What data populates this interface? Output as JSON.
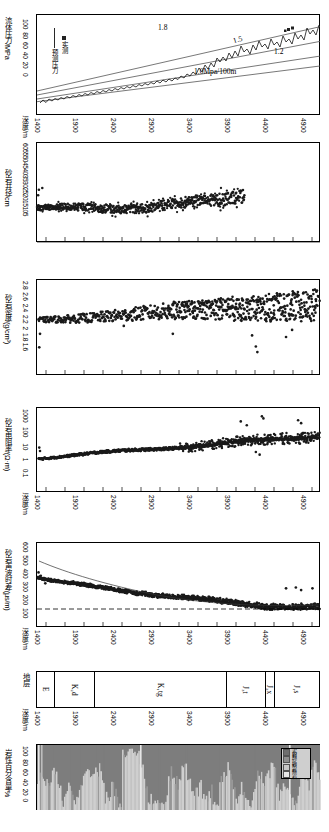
{
  "figure": {
    "xaxis_label": "深度/m",
    "xticks": [
      1400,
      1900,
      2400,
      2900,
      3400,
      3900,
      4400,
      4900
    ],
    "xlim": [
      1400,
      5150
    ]
  },
  "panels": [
    {
      "id": "fluid-pressure",
      "ylabel": "流体压力/MPa",
      "yticks": [
        "0",
        "20",
        "40",
        "60",
        "80",
        "100"
      ],
      "ylim": [
        0,
        105
      ],
      "legend": [
        {
          "marker": "line",
          "label": "预测压力"
        },
        {
          "marker": "square",
          "label": "实测"
        }
      ],
      "annotations": [
        "1.8",
        "1.5",
        "1.2",
        "1.0Mpa/100m"
      ]
    },
    {
      "id": "sandstone-caliper",
      "ylabel": "砂岩井径/cm",
      "yticks": [
        "5",
        "10",
        "15",
        "20",
        "25",
        "30",
        "35",
        "40",
        "45",
        "50",
        "55",
        "60"
      ],
      "ylim": [
        5,
        60
      ]
    },
    {
      "id": "sandstone-density",
      "ylabel": "砂岩密度/(g/cm³)",
      "yticks": [
        "1.6",
        "1.8",
        "2",
        "2.2",
        "2.4",
        "2.6",
        "2.8"
      ],
      "ylim": [
        1.6,
        2.8
      ]
    },
    {
      "id": "sandstone-resistivity",
      "ylabel": "砂岩电阻率/(Ω·m)",
      "yticks": [
        "0.1",
        "1",
        "10",
        "100",
        "1000"
      ],
      "ylim": [
        0.1,
        1000
      ],
      "scale": "log"
    },
    {
      "id": "sandstone-sonic",
      "ylabel": "砂岩声波时差/(μs/m)",
      "yticks": [
        "100",
        "200",
        "300",
        "400",
        "500",
        "600"
      ],
      "ylim": [
        100,
        600
      ],
      "reference_line": 200
    },
    {
      "id": "stratigraphy",
      "ylabel": "地层",
      "units": [
        {
          "label": "E",
          "start": 1400,
          "end": 1640
        },
        {
          "label": "K₂d",
          "start": 1640,
          "end": 2165
        },
        {
          "label": "K₁tg",
          "start": 2165,
          "end": 3930
        },
        {
          "label": "J₃t",
          "start": 3930,
          "end": 4440
        },
        {
          "label": "J₂x",
          "start": 4440,
          "end": 4560
        },
        {
          "label": "J₁s",
          "start": 4560,
          "end": 5150
        }
      ]
    },
    {
      "id": "lithology-percent",
      "ylabel": "岩性百分含量/%",
      "yticks": [
        "0",
        "20",
        "40",
        "60",
        "80",
        "100"
      ],
      "ylim": [
        0,
        100
      ],
      "legend": [
        {
          "label": "泥岩",
          "color": "#6e6e6e"
        },
        {
          "label": "粉砂岩",
          "color": "#8f8f8f"
        },
        {
          "label": "砂岩",
          "color": "#c8c8c8"
        },
        {
          "label": "砾岩",
          "color": "#e8e8e8"
        }
      ]
    }
  ],
  "chart_data": {
    "type": "scatter",
    "title": "",
    "xlabel": "深度/m",
    "grid": false,
    "legend_position": "inside-left",
    "series": [
      {
        "name": "预测压力 (1.0Mpa/100m gradient)",
        "panel": "fluid-pressure",
        "type": "line",
        "x": [
          1400,
          5150
        ],
        "values": [
          14,
          51.5
        ]
      },
      {
        "name": "1.2 gradient",
        "panel": "fluid-pressure",
        "type": "line",
        "x": [
          1400,
          5150
        ],
        "values": [
          16.8,
          61.8
        ]
      },
      {
        "name": "1.5 gradient",
        "panel": "fluid-pressure",
        "type": "line",
        "x": [
          1400,
          5150
        ],
        "values": [
          21,
          77.3
        ]
      },
      {
        "name": "1.8 gradient",
        "panel": "fluid-pressure",
        "type": "line",
        "x": [
          1400,
          5150
        ],
        "values": [
          25.2,
          92.7
        ]
      },
      {
        "name": "实测压力",
        "panel": "fluid-pressure",
        "type": "line-rough",
        "x": [
          1400,
          1500,
          1600,
          1700,
          1800,
          1900,
          2000,
          2100,
          2200,
          2300,
          2400,
          2500,
          2600,
          2700,
          2800,
          2900,
          3000,
          3100,
          3200,
          3300,
          3400,
          3500,
          3600,
          3700,
          3800,
          3900,
          4000,
          4100,
          4200,
          4300,
          4400,
          4500,
          4600,
          4700,
          4800,
          4900,
          5000,
          5100
        ],
        "values": [
          12,
          14,
          15,
          17,
          18,
          19,
          20,
          22,
          23,
          25,
          26,
          28,
          29,
          31,
          32,
          34,
          35,
          36,
          38,
          40,
          42,
          45,
          49,
          54,
          58,
          62,
          66,
          64,
          70,
          68,
          74,
          72,
          78,
          82,
          80,
          86,
          92,
          98
        ]
      },
      {
        "name": "砂岩井径",
        "panel": "sandstone-caliper",
        "type": "scatter",
        "x_range": [
          1400,
          4150
        ],
        "value_range": [
          22,
          34
        ],
        "trend": "flat-then-rise"
      },
      {
        "name": "砂岩密度",
        "panel": "sandstone-density",
        "type": "scatter",
        "x_range": [
          1420,
          5130
        ],
        "value_range": [
          1.95,
          2.72
        ],
        "trend": "rising"
      },
      {
        "name": "砂岩电阻率",
        "panel": "sandstone-resistivity",
        "type": "scatter",
        "x_range": [
          1420,
          5130
        ],
        "value_range": [
          3,
          300
        ],
        "trend": "rising-log"
      },
      {
        "name": "砂岩声波时差",
        "panel": "sandstone-sonic",
        "type": "scatter",
        "x_range": [
          1410,
          5130
        ],
        "value_range": [
          190,
          420
        ],
        "trend": "falling"
      },
      {
        "name": "岩性百分含量",
        "panel": "lithology-percent",
        "type": "stacked-bar",
        "x_range": [
          1400,
          5150
        ],
        "value_range": [
          0,
          100
        ]
      }
    ]
  }
}
